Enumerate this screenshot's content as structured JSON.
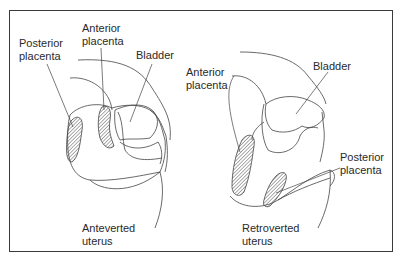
{
  "figure": {
    "colors": {
      "line": "#444444",
      "frame": "#3a3a3a",
      "text": "#2a2a2a",
      "hatch": "#555555",
      "background": "#ffffff"
    },
    "left_diagram": {
      "title": [
        "Anteverted",
        "uterus"
      ],
      "labels": {
        "posterior_placenta": [
          "Posterior",
          "placenta"
        ],
        "anterior_placenta": [
          "Anterior",
          "placenta"
        ],
        "bladder": "Bladder"
      }
    },
    "right_diagram": {
      "title": [
        "Retroverted",
        "uterus"
      ],
      "labels": {
        "anterior_placenta": [
          "Anterior",
          "placenta"
        ],
        "bladder": "Bladder",
        "posterior_placenta": [
          "Posterior",
          "placenta"
        ]
      }
    }
  }
}
